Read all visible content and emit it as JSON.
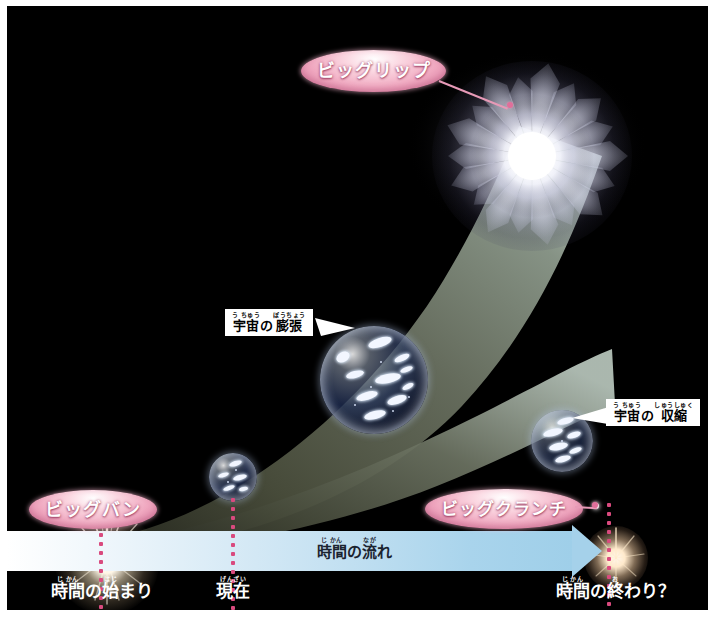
{
  "figure": {
    "background_color": "#000000",
    "accent_pink": "#e79ab7",
    "accent_blue": "#a5d1ea"
  },
  "callouts": {
    "big_rip": {
      "label": "ビッグリップ",
      "icon": "oval-callout"
    },
    "big_bang": {
      "label": "ビッグバン",
      "icon": "oval-callout"
    },
    "big_crunch": {
      "label": "ビッグクランチ",
      "icon": "oval-callout"
    }
  },
  "annotations": {
    "expansion": {
      "ruby_1": "う ちゅう",
      "base_1": "宇宙",
      "base_2": "の",
      "ruby_3": "ぼうちょう",
      "base_3": "膨張",
      "full": "宇宙の膨張"
    },
    "contraction": {
      "ruby_1": "う ちゅう",
      "base_1": "宇宙",
      "base_2": "の",
      "ruby_3": "しゅうしゅく",
      "base_3": "収縮",
      "full": "宇宙の収縮"
    }
  },
  "timeline": {
    "arrow_label": {
      "ruby_1": "じ かん",
      "base_1": "時間",
      "base_2": "の",
      "ruby_3": "なが",
      "base_3": "流",
      "base_4": "れ",
      "full": "時間の流れ"
    },
    "ticks": [
      {
        "id": "start-of-time",
        "ruby_1": "じ かん",
        "base_1": "時間",
        "base_2": "の",
        "ruby_3": "はじ",
        "base_3": "始",
        "base_4": "まり",
        "full": "時間の始まり"
      },
      {
        "id": "present",
        "ruby_1": "げんざい",
        "base_1": "現在",
        "base_2": "",
        "ruby_3": "",
        "base_3": "",
        "base_4": "",
        "full": "現在"
      },
      {
        "id": "end-of-time",
        "ruby_1": "じ かん",
        "base_1": "時間",
        "base_2": "の",
        "ruby_3": "お",
        "base_3": "終",
        "base_4": "わり？",
        "full": "時間の終わり？"
      }
    ]
  },
  "objects": {
    "universe_small": {
      "name": "universe-sphere-small"
    },
    "universe_large": {
      "name": "universe-sphere-large"
    },
    "universe_shrinking": {
      "name": "universe-sphere-shrinking"
    },
    "big_bang_flash": {
      "name": "big-bang-flash"
    },
    "big_rip_burst": {
      "name": "big-rip-burst"
    },
    "big_crunch_flash": {
      "name": "big-crunch-flash"
    }
  }
}
